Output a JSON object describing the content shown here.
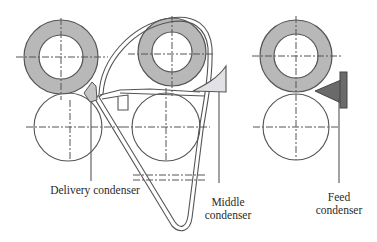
{
  "diagram": {
    "type": "roller condenser arrangement schematic",
    "labels": {
      "delivery": "Delivery condenser",
      "middle_line1": "Middle",
      "middle_line2": "condenser",
      "feed_line1": "Feed",
      "feed_line2": "condenser"
    },
    "colors": {
      "ring_fill": "#b8b8b8",
      "line": "#555555",
      "middle_condenser_fill": "#e2e2e6",
      "feed_condenser_fill": "#6a6a6a"
    },
    "components": [
      {
        "id": "left-top-roller",
        "kind": "shaded ring roller"
      },
      {
        "id": "left-bottom-roller",
        "kind": "plain roller"
      },
      {
        "id": "middle-top-roller",
        "kind": "shaded ring roller"
      },
      {
        "id": "middle-bottom-roller",
        "kind": "plain roller"
      },
      {
        "id": "right-top-roller",
        "kind": "shaded ring roller"
      },
      {
        "id": "right-bottom-roller",
        "kind": "plain roller"
      },
      {
        "id": "apron-belt",
        "kind": "looped belt"
      },
      {
        "id": "delivery-condenser",
        "kind": "condenser"
      },
      {
        "id": "middle-condenser",
        "kind": "condenser"
      },
      {
        "id": "feed-condenser",
        "kind": "condenser"
      }
    ]
  }
}
